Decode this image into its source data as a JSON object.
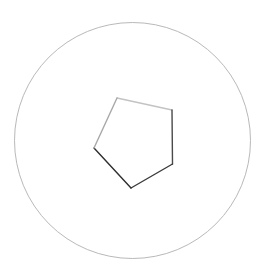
{
  "canvas": {
    "width": 267,
    "height": 275,
    "background_color": "#ffffff",
    "title": "Shape Canvas"
  },
  "chart_data": {
    "type": "scatter",
    "title": "",
    "subtitle": "",
    "xlabel": "",
    "ylabel": "",
    "grid": false,
    "legend": "none",
    "xlim": [
      0,
      267
    ],
    "ylim": [
      0,
      275
    ],
    "shapes": [
      {
        "name": "outer-circle",
        "kind": "circle",
        "cx": 132.5,
        "cy": 140.5,
        "r": 118,
        "fill": "none",
        "stroke": "#b9b9b9",
        "stroke_width": 1
      },
      {
        "name": "inner-pentagon",
        "kind": "polygon",
        "fill": "none",
        "stroke_width": 1.4,
        "vertices": [
          {
            "label": "top",
            "x": 117,
            "y": 98
          },
          {
            "label": "upper-right",
            "x": 172,
            "y": 110
          },
          {
            "label": "lower-right",
            "x": 172.5,
            "y": 164
          },
          {
            "label": "bottom",
            "x": 131,
            "y": 188
          },
          {
            "label": "left",
            "x": 94,
            "y": 148
          }
        ],
        "edges": [
          {
            "name": "edge-top",
            "from": "top",
            "to": "upper-right",
            "stroke": "#c3c3c3"
          },
          {
            "name": "edge-right",
            "from": "upper-right",
            "to": "lower-right",
            "stroke": "#4a4a4a"
          },
          {
            "name": "edge-bottom-right",
            "from": "lower-right",
            "to": "bottom",
            "stroke": "#3a3a3a"
          },
          {
            "name": "edge-bottom-left",
            "from": "bottom",
            "to": "left",
            "stroke": "#2e2e2e"
          },
          {
            "name": "edge-upper-left",
            "from": "left",
            "to": "top",
            "stroke": "#a8a8a8"
          }
        ]
      }
    ]
  }
}
